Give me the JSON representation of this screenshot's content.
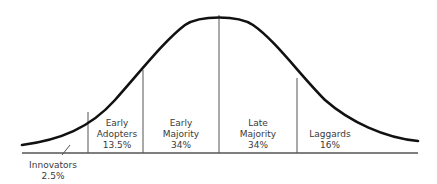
{
  "diagram": {
    "type": "bell-curve",
    "colors": {
      "curve": "#111111",
      "divider": "#555555",
      "baseline": "#555555",
      "text": "#3a3a3a"
    },
    "segments": [
      {
        "name": "Innovators",
        "line1": "Innovators",
        "line2": "2.5%",
        "percent": 2.5
      },
      {
        "name": "Early Adopters",
        "line1": "Early",
        "line2": "Adopters",
        "line3": "13.5%",
        "percent": 13.5
      },
      {
        "name": "Early Majority",
        "line1": "Early",
        "line2": "Majority",
        "line3": "34%",
        "percent": 34
      },
      {
        "name": "Late Majority",
        "line1": "Late",
        "line2": "Majority",
        "line3": "34%",
        "percent": 34
      },
      {
        "name": "Laggards",
        "line1": "Laggards",
        "line2": "16%",
        "percent": 16
      }
    ]
  }
}
